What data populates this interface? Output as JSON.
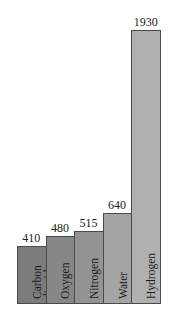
{
  "chart_data": {
    "type": "bar",
    "title": "",
    "xlabel": "",
    "ylabel": "",
    "categories": [
      "Carbon dioxide",
      "Oxygen",
      "Nitrogen",
      "Water",
      "Hydrogen"
    ],
    "values": [
      410,
      480,
      515,
      640,
      1930
    ],
    "ylim": [
      0,
      1930
    ],
    "grid": false,
    "legend": null,
    "colors": [
      "#7c7c7c",
      "#878787",
      "#939393",
      "#a4a4a4",
      "#b0b0b0"
    ]
  },
  "bars": [
    {
      "label": "Carbon\ndioxide",
      "line1": "Carbon",
      "line2": "dioxide",
      "value": "410",
      "color": "#7c7c7c"
    },
    {
      "label": "Oxygen",
      "value": "480",
      "color": "#878787"
    },
    {
      "label": "Nitrogen",
      "value": "515",
      "color": "#939393"
    },
    {
      "label": "Water",
      "value": "640",
      "color": "#a4a4a4"
    },
    {
      "label": "Hydrogen",
      "value": "1930",
      "color": "#b0b0b0"
    }
  ]
}
